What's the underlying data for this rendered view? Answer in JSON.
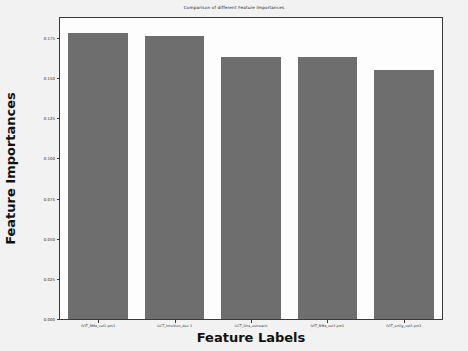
{
  "chart_data": {
    "type": "bar",
    "title": "Comparison of different Feature Importances",
    "xlabel": "Feature Labels",
    "ylabel": "Feature Importances",
    "categories": [
      "IVIT_RMa_vel1 pm1",
      "OCT_Intuition_dev 1",
      "OCT_Dhs_outreach",
      "IVIT_RMa_vel3 pm1",
      "IVIT_enVg_vel3 pm1"
    ],
    "values": [
      0.178,
      0.176,
      0.163,
      0.163,
      0.155
    ],
    "ylim": [
      0.0,
      0.1874
    ],
    "yticks": [
      0.0,
      0.025,
      0.05,
      0.075,
      0.1,
      0.125,
      0.15,
      0.175
    ],
    "ytick_labels": [
      "0.000",
      "0.025",
      "0.050",
      "0.075",
      "0.100",
      "0.125",
      "0.150",
      "0.175"
    ],
    "grid": false,
    "legend": null,
    "bar_color": "#6e6e6e",
    "plot_background": "#fdfdfd",
    "figure_background": "#f2f2f2",
    "axis_color": "#3a3a3a"
  }
}
